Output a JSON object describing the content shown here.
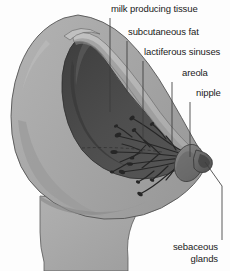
{
  "diagram": {
    "background_color": "#fdfdfd",
    "colors": {
      "skin": "#a9a9a9",
      "skin_shadow": "#8f8f8f",
      "skin_highlight": "#bcbcbc",
      "interior_dark": "#4a4a4a",
      "interior_darker": "#3a3a3a",
      "fat_band": "#b4b4b4",
      "duct": "#2b2b2b",
      "outline": "#4f4f4f",
      "leader_line": "#3c3c3c",
      "text": "#1a1a1a"
    },
    "labels": [
      {
        "id": "milk-producing-tissue",
        "text": "milk  producing tissue",
        "x": 111,
        "y": 4,
        "align": "left",
        "leader": {
          "x1": 110,
          "y1": 18,
          "x2": 110,
          "y2": 112
        }
      },
      {
        "id": "subcutaneous-fat",
        "text": "subcutaneous fat",
        "x": 128,
        "y": 27,
        "align": "left",
        "leader": {
          "x1": 127,
          "y1": 41,
          "x2": 127,
          "y2": 92
        }
      },
      {
        "id": "lactiferous-sinuses",
        "text": "lactiferous sinuses",
        "x": 144,
        "y": 47,
        "align": "left",
        "leader": {
          "x1": 143,
          "y1": 61,
          "x2": 143,
          "y2": 140
        }
      },
      {
        "id": "areola",
        "text": "areola",
        "x": 182,
        "y": 68,
        "align": "left",
        "leader": {
          "x1": 172,
          "y1": 82,
          "x2": 172,
          "y2": 146
        }
      },
      {
        "id": "nipple",
        "text": "nipple",
        "x": 196,
        "y": 88,
        "align": "left",
        "leader": {
          "x1": 190,
          "y1": 102,
          "x2": 190,
          "y2": 157
        }
      },
      {
        "id": "sebaceous-glands",
        "text": "sebaceous\nglands",
        "line1": "sebaceous",
        "line2": "glands",
        "x": 168,
        "y": 242,
        "align": "right",
        "leader_path": "M 205 162 L 222 186 L 222 240"
      }
    ]
  }
}
